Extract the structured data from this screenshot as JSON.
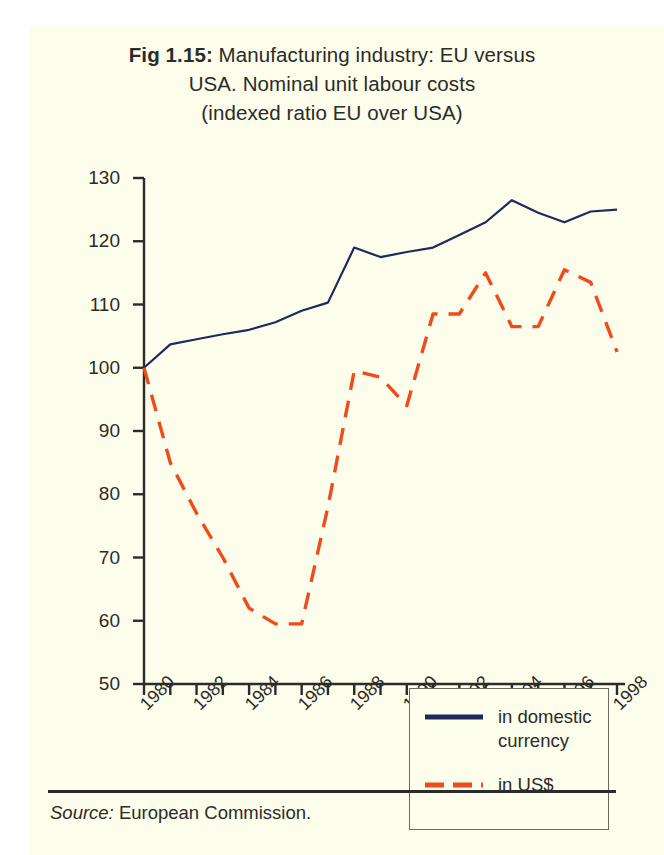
{
  "figure": {
    "label": "Fig 1.15:",
    "title_line1": "Manufacturing industry: EU versus",
    "title_line2": "USA. Nominal unit labour costs",
    "title_line3": "(indexed ratio EU over USA)",
    "source_label": "Source:",
    "source_text": "European Commission."
  },
  "colors": {
    "background": "#fdfdec",
    "axis": "#2b2b28",
    "text": "#2b2b28",
    "domestic_currency": "#1f2a5c",
    "us_dollar": "#ef4b1c",
    "legend_border": "#6a6a5c"
  },
  "legend": {
    "position": "inside-bottom-right",
    "items": [
      {
        "label_line1": "in domestic",
        "label_line2": "currency",
        "style": "solid",
        "color": "#1f2a5c"
      },
      {
        "label_line1": "in US$",
        "label_line2": "",
        "style": "dashed",
        "color": "#ef4b1c"
      }
    ]
  },
  "chart_data": {
    "type": "line",
    "title": "Fig 1.15: Manufacturing industry: EU versus USA. Nominal unit labour costs (indexed ratio EU over USA)",
    "xlabel": "",
    "ylabel": "",
    "xlim": [
      1980,
      1998
    ],
    "ylim": [
      50,
      130
    ],
    "yticks": [
      50,
      60,
      70,
      80,
      90,
      100,
      110,
      120,
      130
    ],
    "xticks": [
      1980,
      1981,
      1982,
      1983,
      1984,
      1985,
      1986,
      1987,
      1988,
      1989,
      1990,
      1991,
      1992,
      1993,
      1994,
      1995,
      1996,
      1997,
      1998
    ],
    "xticklabels": [
      "1980",
      "",
      "1982",
      "",
      "1984",
      "",
      "1986",
      "",
      "1988",
      "",
      "1990",
      "",
      "1992",
      "",
      "1994",
      "",
      "1996",
      "",
      "1998"
    ],
    "grid": false,
    "x": [
      1980,
      1981,
      1982,
      1983,
      1984,
      1985,
      1986,
      1987,
      1988,
      1989,
      1990,
      1991,
      1992,
      1993,
      1994,
      1995,
      1996,
      1997,
      1998
    ],
    "series": [
      {
        "name": "in domestic currency",
        "style": "solid",
        "color": "#1f2a5c",
        "values": [
          100.0,
          103.7,
          104.5,
          105.3,
          106.0,
          107.2,
          109.0,
          110.3,
          119.0,
          117.5,
          118.3,
          119.0,
          121.0,
          123.0,
          126.5,
          124.5,
          123.0,
          124.7,
          125.0
        ]
      },
      {
        "name": "in US$",
        "style": "dashed",
        "color": "#ef4b1c",
        "values": [
          100.0,
          85.0,
          77.0,
          70.0,
          62.0,
          59.5,
          59.5,
          78.0,
          99.5,
          98.5,
          94.0,
          108.5,
          108.5,
          115.0,
          106.5,
          106.5,
          115.5,
          113.5,
          102.5
        ]
      }
    ]
  },
  "axes": {
    "ytick_labels": [
      "130",
      "120",
      "110",
      "100",
      "90",
      "80",
      "70",
      "60",
      "50"
    ],
    "xtick_labels": [
      "1980",
      "1982",
      "1984",
      "1986",
      "1988",
      "1990",
      "1992",
      "1994",
      "1996",
      "1998"
    ]
  }
}
